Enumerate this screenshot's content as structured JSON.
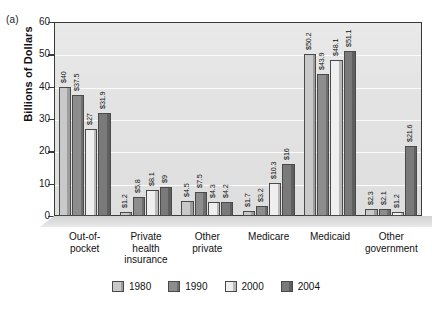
{
  "panel_label": "(a)",
  "chart_data": {
    "type": "bar",
    "title": "",
    "xlabel": "",
    "ylabel": "Billions of Dollars",
    "ylim": [
      0,
      60
    ],
    "yticks": [
      0,
      10,
      20,
      30,
      40,
      50,
      60
    ],
    "grid": true,
    "legend_position": "bottom",
    "categories": [
      "Out-of-pocket",
      "Private health insurance",
      "Other private",
      "Medicare",
      "Medicaid",
      "Other government"
    ],
    "category_lines": [
      [
        "Out-of-",
        "pocket"
      ],
      [
        "Private",
        "health",
        "insurance"
      ],
      [
        "Other",
        "private"
      ],
      [
        "Medicare"
      ],
      [
        "Medicaid"
      ],
      [
        "Other",
        "government"
      ]
    ],
    "series": [
      {
        "name": "1980",
        "color": "#c9c9c9",
        "values": [
          40,
          1.2,
          4.5,
          1.7,
          50.2,
          2.3
        ],
        "labels": [
          "$40",
          "$1.2",
          "$4.5",
          "$1.7",
          "$50.2",
          "$2.3"
        ]
      },
      {
        "name": "1990",
        "color": "#8d8d8d",
        "values": [
          37.5,
          5.8,
          7.5,
          3.2,
          43.9,
          2.1
        ],
        "labels": [
          "$37.5",
          "$5.8",
          "$7.5",
          "$3.2",
          "$43.9",
          "$2.1"
        ]
      },
      {
        "name": "2000",
        "color": "#efefef",
        "values": [
          27,
          8.1,
          4.3,
          10.3,
          48.1,
          1.2
        ],
        "labels": [
          "$27",
          "$8.1",
          "$4.3",
          "$10.3",
          "$48.1",
          "$1.2"
        ]
      },
      {
        "name": "2004",
        "color": "#7a7a7a",
        "values": [
          31.9,
          9,
          4.2,
          16,
          51.1,
          21.6
        ],
        "labels": [
          "$31.9",
          "$9",
          "$4.2",
          "$16",
          "$51.1",
          "$21.6"
        ]
      }
    ]
  }
}
